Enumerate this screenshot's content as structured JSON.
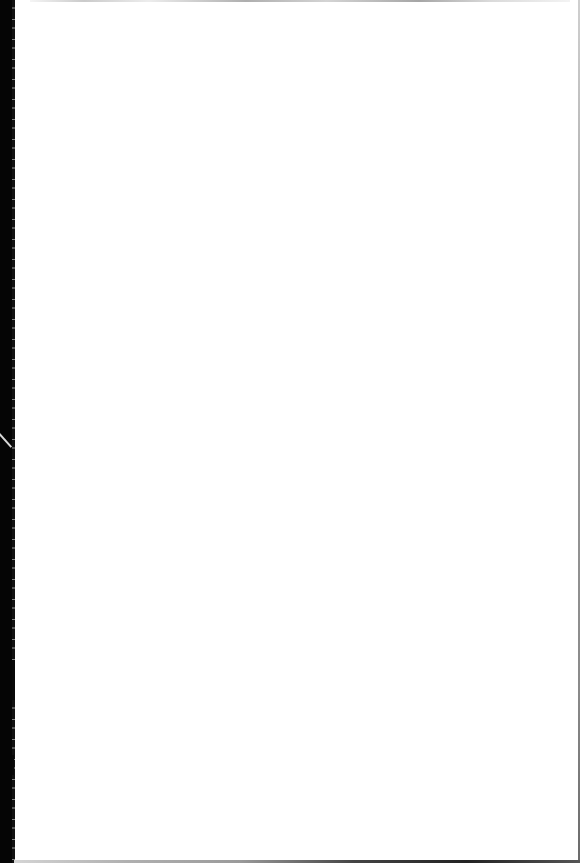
{
  "document": {
    "type": "scanned-page",
    "content": "",
    "colors": {
      "paper": "#ffffff",
      "binding_shadow": "#050505"
    }
  }
}
